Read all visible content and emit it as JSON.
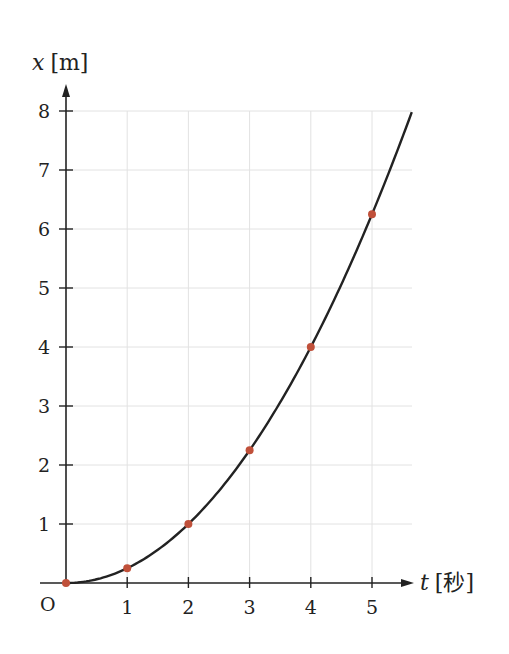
{
  "chart_data": {
    "type": "line",
    "title": "",
    "xlabel": "t [秒]",
    "ylabel": "x [m]",
    "x_var": "t",
    "x_unit": "[秒]",
    "y_var": "x",
    "y_unit": "[m]",
    "origin_label": "O",
    "x_ticks": [
      "1",
      "2",
      "3",
      "4",
      "5"
    ],
    "y_ticks": [
      "1",
      "2",
      "3",
      "4",
      "5",
      "6",
      "7",
      "8"
    ],
    "xlim": [
      0,
      5.6
    ],
    "ylim": [
      0,
      8
    ],
    "grid": true,
    "series": [
      {
        "name": "x = t²/4",
        "type": "line",
        "color": "#222222",
        "function": "x = 0.25 * t^2",
        "t_range": [
          0,
          5.65
        ]
      },
      {
        "name": "measured points",
        "type": "scatter",
        "color": "#c0503a",
        "x": [
          0,
          1,
          2,
          3,
          4,
          5
        ],
        "y": [
          0,
          0.25,
          1,
          2.25,
          4,
          6.25
        ]
      }
    ]
  }
}
